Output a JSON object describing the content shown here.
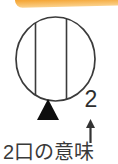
{
  "colors": {
    "accent_top": "#E98D1D",
    "accent_mid": "#F5A93C",
    "accent_bottom": "#FBD28D",
    "outline": "#3B3B3B",
    "marker": "#0D0D0D",
    "text": "#333333",
    "background": "#FFFFFF"
  },
  "diagram": {
    "symbol": "two-outlet-receptacle-symbol",
    "count_label": "2",
    "arrow": "up-arrow",
    "caption": "2口の意味"
  }
}
